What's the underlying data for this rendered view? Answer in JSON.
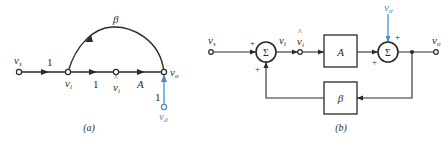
{
  "colors": {
    "ink": "#2a2a2a",
    "disturbance": "#4a8bd0",
    "background": "#ffffff"
  },
  "panel_a": {
    "caption": "(a)",
    "type": "signal-flow-graph",
    "nodes": {
      "source": "v",
      "source_sub": "s",
      "error": "v",
      "error_sub": "i",
      "amp_input": "v",
      "amp_input_sub": "i",
      "amp_input_hat": "^",
      "output": "v",
      "output_sub": "o",
      "disturbance": "v",
      "disturbance_sub": "d"
    },
    "branches": {
      "source_to_error_gain": "1",
      "error_to_amp_input_gain": "1",
      "amp_gain": "A",
      "feedback_gain": "β",
      "disturbance_gain": "1"
    }
  },
  "panel_b": {
    "caption": "(b)",
    "type": "block-diagram",
    "labels": {
      "source": "v",
      "source_sub": "s",
      "error": "v",
      "error_sub": "i",
      "amp_input": "v",
      "amp_input_sub": "i",
      "amp_input_hat": "^",
      "output": "v",
      "output_sub": "o",
      "disturbance": "v",
      "disturbance_sub": "d"
    },
    "sum1": {
      "symbol": "Σ",
      "input_sign_left": "+",
      "input_sign_bottom": "+"
    },
    "sum2": {
      "symbol": "Σ",
      "input_sign_top": "+",
      "input_sign_left": "+"
    },
    "forward_block": "A",
    "feedback_block": "β"
  }
}
